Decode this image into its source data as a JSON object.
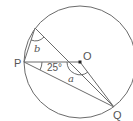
{
  "diagram": {
    "type": "circle-geometry",
    "circle": {
      "center_label": "O"
    },
    "points": {
      "P": "P",
      "O": "O",
      "Q": "Q"
    },
    "angles": {
      "given": "25°",
      "unknown_a": "a",
      "unknown_b": "b"
    },
    "colors": {
      "line": "#6b6b6b",
      "text": "#555555",
      "center_dot": "#222222"
    }
  }
}
